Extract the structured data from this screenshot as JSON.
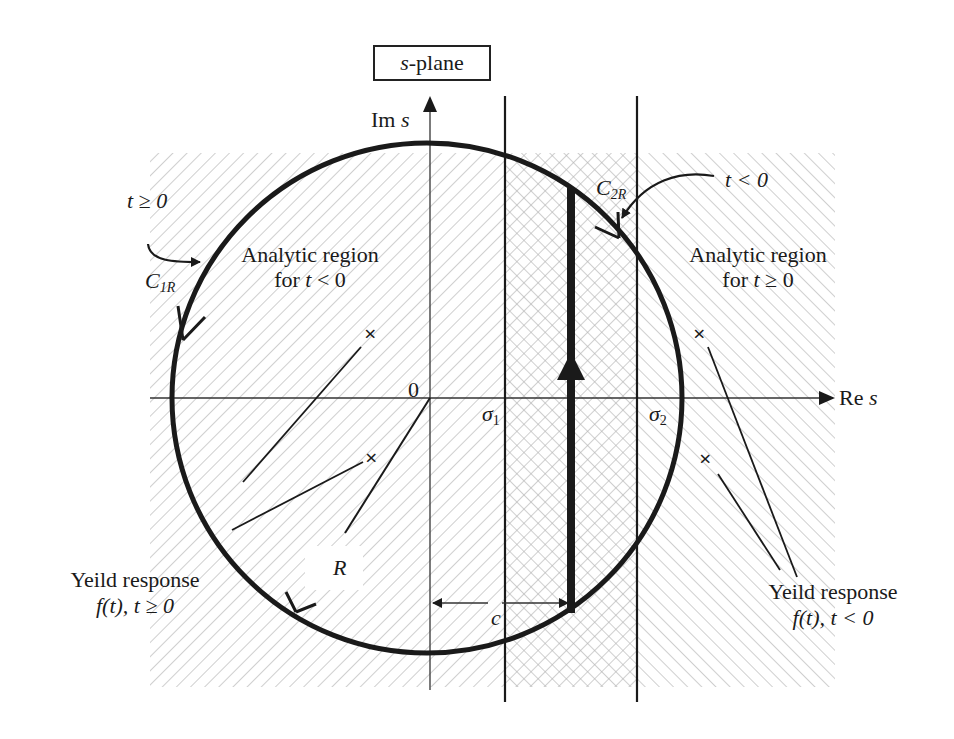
{
  "diagram": {
    "title": "s-plane",
    "title_var": "s",
    "title_rest": "-plane",
    "axes": {
      "imag_label": "Im",
      "imag_var": "s",
      "real_label": "Re",
      "real_var": "s",
      "origin_label": "0"
    },
    "abscissas": {
      "sigma1": "σ",
      "sigma1_sub": "1",
      "sigma2": "σ",
      "sigma2_sub": "2",
      "c_label": "c"
    },
    "contours": {
      "c1r_main": "C",
      "c1r_sub": "1R",
      "c1r_condition": "t ≥ 0",
      "c2r_main": "C",
      "c2r_sub": "2R",
      "c2r_condition": "t < 0",
      "radius_label": "R"
    },
    "regions": {
      "left_line1": "Analytic region",
      "left_line2_pre": "for ",
      "left_line2_var": "t",
      "left_line2_post": " < 0",
      "right_line1": "Analytic region",
      "right_line2_pre": "for ",
      "right_line2_var": "t",
      "right_line2_post": " ≥ 0"
    },
    "annotations": {
      "left_line1": "Yeild response",
      "left_line2": "f(t), t ≥ 0",
      "right_line1": "Yeild response",
      "right_line2": "f(t), t < 0"
    },
    "poles": [
      {
        "side": "left",
        "symbol": "×"
      },
      {
        "side": "left",
        "symbol": "×"
      },
      {
        "side": "right",
        "symbol": "×"
      },
      {
        "side": "right",
        "symbol": "×"
      }
    ],
    "colors": {
      "ink": "#1a1a1a",
      "hatch": "#b8b8b8",
      "background": "#ffffff"
    }
  }
}
